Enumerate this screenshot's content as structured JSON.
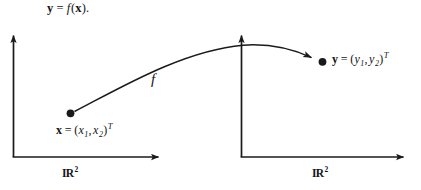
{
  "figure": {
    "caption_equation": {
      "lhs": "y",
      "equals": "=",
      "function": "f",
      "open_paren": "(",
      "arg": "x",
      "close_paren": ")",
      "period": "."
    },
    "domain_point": {
      "vector": "x",
      "equals": "=",
      "open_paren": "(",
      "component_1_base": "x",
      "component_1_sub": "1",
      "comma": ",",
      "component_2_base": "x",
      "component_2_sub": "2",
      "close_paren": ")",
      "transpose": "T"
    },
    "codomain_point": {
      "vector": "y",
      "equals": "=",
      "open_paren": "(",
      "component_1_base": "y",
      "component_1_sub": "1",
      "comma": ",",
      "component_2_base": "y",
      "component_2_sub": "2",
      "close_paren": ")",
      "transpose": "T"
    },
    "map_label": "f",
    "domain_space": {
      "symbol": "IR",
      "exponent": "2"
    },
    "codomain_space": {
      "symbol": "IR",
      "exponent": "2"
    },
    "colors": {
      "ink": "#1a1a1a",
      "background": "#ffffff"
    }
  }
}
